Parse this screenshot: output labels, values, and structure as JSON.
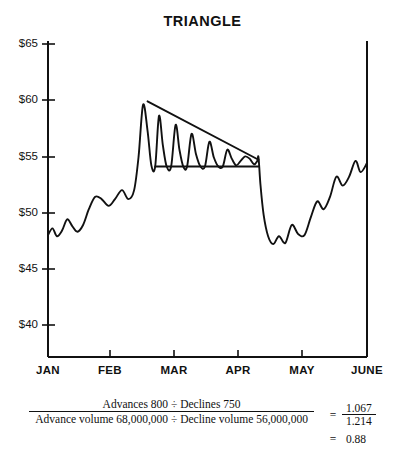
{
  "chart_data": {
    "type": "line",
    "title": "TRIANGLE",
    "xlabel": "",
    "ylabel": "",
    "ylim": [
      38,
      65
    ],
    "xlim": [
      0,
      5
    ],
    "grid": false,
    "legend": null,
    "y_ticks": [
      "$65",
      "$60",
      "$55",
      "$50",
      "$45",
      "$40"
    ],
    "y_tick_values": [
      65,
      60,
      55,
      50,
      45,
      40
    ],
    "x_ticks": [
      "JAN",
      "FEB",
      "MAR",
      "APR",
      "MAY",
      "JUNE"
    ],
    "x_tick_values": [
      0,
      1,
      2,
      3,
      4,
      5
    ],
    "series": [
      {
        "name": "price",
        "x": [
          0.0,
          0.07,
          0.14,
          0.22,
          0.3,
          0.38,
          0.46,
          0.55,
          0.64,
          0.74,
          0.84,
          0.95,
          1.05,
          1.16,
          1.26,
          1.35,
          1.42,
          1.49,
          1.56,
          1.62,
          1.68,
          1.74,
          1.8,
          1.86,
          1.93,
          2.0,
          2.06,
          2.12,
          2.18,
          2.25,
          2.32,
          2.39,
          2.46,
          2.53,
          2.6,
          2.67,
          2.74,
          2.81,
          2.88,
          2.95,
          3.02,
          3.09,
          3.16,
          3.23,
          3.28,
          3.3,
          3.33,
          3.38,
          3.45,
          3.53,
          3.62,
          3.72,
          3.82,
          3.92,
          4.02,
          4.12,
          4.22,
          4.32,
          4.42,
          4.52,
          4.62,
          4.72,
          4.82,
          4.9,
          5.0
        ],
        "y": [
          48.0,
          48.6,
          47.9,
          48.4,
          49.4,
          48.8,
          48.3,
          48.9,
          50.3,
          51.4,
          51.2,
          50.6,
          51.2,
          52.0,
          51.2,
          52.0,
          55.0,
          59.6,
          57.3,
          54.2,
          54.1,
          58.6,
          56.0,
          54.1,
          54.1,
          57.8,
          55.6,
          54.1,
          54.1,
          57.0,
          55.2,
          54.1,
          54.1,
          56.3,
          54.9,
          54.1,
          54.1,
          55.6,
          54.8,
          54.2,
          54.6,
          55.0,
          54.8,
          54.3,
          54.6,
          54.9,
          52.5,
          49.8,
          47.9,
          47.2,
          47.9,
          47.3,
          48.9,
          48.1,
          48.0,
          49.6,
          51.0,
          50.3,
          51.4,
          53.2,
          52.4,
          53.2,
          54.6,
          53.6,
          54.4
        ],
        "note": "stock price path showing descending triangle consolidation then breakdown and recovery"
      }
    ],
    "annotations": [
      {
        "name": "upper-trendline",
        "type": "line",
        "description": "descending resistance trendline",
        "from": [
          1.56,
          59.9
        ],
        "to": [
          3.3,
          54.7
        ]
      },
      {
        "name": "lower-trendline",
        "type": "line",
        "description": "horizontal support trendline",
        "from": [
          1.68,
          54.1
        ],
        "to": [
          3.3,
          54.1
        ]
      }
    ]
  },
  "formula": {
    "numerator": "Advances 800 ÷ Declines 750",
    "denominator": "Advance volume 68,000,000 ÷ Decline volume 56,000,000",
    "equals_sign_1": "=",
    "ratio_numerator": "1.067",
    "ratio_denominator": "1.214",
    "equals_sign_2": "=",
    "result": "0.88"
  },
  "colors": {
    "ink": "#111111",
    "background": "#ffffff"
  }
}
